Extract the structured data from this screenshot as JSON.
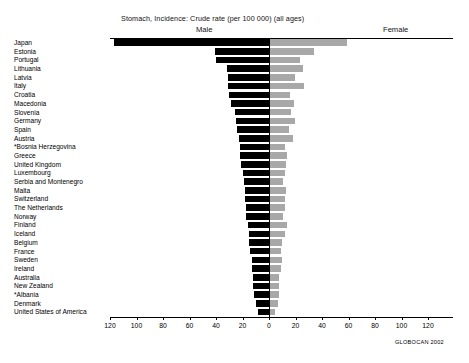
{
  "header": {
    "title": "Stomach, Incidence: Crude rate (per 100 000) (all ages)",
    "male_label": "Male",
    "female_label": "Female"
  },
  "source": {
    "note": "GLOBOCAN 2002"
  },
  "chart_data": {
    "type": "bar",
    "orientation": "horizontal-diverging",
    "title": "Stomach, Incidence: Crude rate (per 100 000) (all ages)",
    "xlabel": "",
    "ylabel": "",
    "xlim": [
      -120,
      120
    ],
    "grid": false,
    "legend_position": "top",
    "axis_ticks": [
      120,
      100,
      80,
      60,
      40,
      20,
      0,
      20,
      40,
      60,
      80,
      100,
      120
    ],
    "colors": {
      "male": "#000000",
      "female": "#a8a8a8",
      "axis": "#000000",
      "background": "#ffffff"
    },
    "categories": [
      "Japan",
      "Estonia",
      "Portugal",
      "Lithuania",
      "Latvia",
      "Italy",
      "Croatia",
      "Macedonia",
      "Slovenia",
      "Germany",
      "Spain",
      "Austria",
      "*Bosnia Herzegovina",
      "Greece",
      "United Kingdom",
      "Luxembourg",
      "Serbia and Montenegro",
      "Malta",
      "Switzerland",
      "The Netherlands",
      "Norway",
      "Finland",
      "Iceland",
      "Belgium",
      "France",
      "Sweden",
      "Ireland",
      "Australia",
      "New Zealand",
      "*Albania",
      "Denmark",
      "United States of America"
    ],
    "series": [
      {
        "name": "Male",
        "values": [
          117,
          41,
          40,
          32,
          31,
          31,
          30,
          29,
          26,
          25,
          24,
          23,
          22,
          22,
          21,
          20,
          19,
          18,
          18,
          17,
          17,
          16,
          15,
          15,
          14,
          13,
          13,
          12,
          12,
          11,
          10,
          8
        ]
      },
      {
        "name": "Female",
        "values": [
          58,
          33,
          23,
          25,
          19,
          26,
          15,
          18,
          16,
          19,
          14,
          17,
          11,
          13,
          12,
          11,
          10,
          12,
          11,
          11,
          10,
          13,
          11,
          9,
          8,
          9,
          8,
          7,
          7,
          7,
          6,
          4
        ]
      }
    ]
  }
}
